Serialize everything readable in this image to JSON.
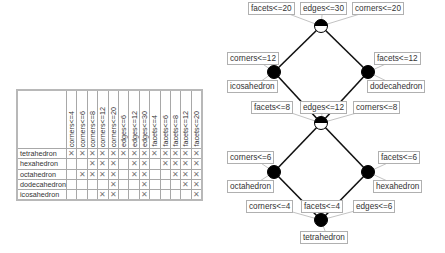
{
  "context_table": {
    "attributes": [
      "corners<=4",
      "corners<=6",
      "corners<=8",
      "corners<=12",
      "corners<=20",
      "edges<=6",
      "edges<=12",
      "edges<=30",
      "facets<=4",
      "facets<=6",
      "facets<=8",
      "facets<=12",
      "facets<=20"
    ],
    "cross_glyph": "✕",
    "objects": [
      {
        "name": "tetrahedron",
        "cells": [
          1,
          1,
          1,
          1,
          1,
          1,
          1,
          1,
          1,
          1,
          1,
          1,
          1
        ]
      },
      {
        "name": "hexahedron",
        "cells": [
          0,
          0,
          1,
          1,
          1,
          0,
          1,
          1,
          0,
          1,
          1,
          1,
          1
        ]
      },
      {
        "name": "octahedron",
        "cells": [
          0,
          1,
          1,
          1,
          1,
          0,
          1,
          1,
          0,
          0,
          1,
          1,
          1
        ]
      },
      {
        "name": "dodecahedron",
        "cells": [
          0,
          0,
          0,
          0,
          1,
          0,
          0,
          1,
          0,
          0,
          0,
          1,
          1
        ]
      },
      {
        "name": "icosahedron",
        "cells": [
          0,
          0,
          0,
          1,
          1,
          0,
          0,
          1,
          0,
          0,
          0,
          0,
          1
        ]
      }
    ]
  },
  "lattice": {
    "nodes": [
      {
        "id": "top",
        "x": 321,
        "y": 26,
        "fill": "half"
      },
      {
        "id": "icosa",
        "x": 274,
        "y": 72,
        "fill": "full"
      },
      {
        "id": "dodeca",
        "x": 368,
        "y": 72,
        "fill": "full"
      },
      {
        "id": "mid",
        "x": 321,
        "y": 123,
        "fill": "half"
      },
      {
        "id": "octa",
        "x": 274,
        "y": 172,
        "fill": "full"
      },
      {
        "id": "hexa",
        "x": 368,
        "y": 172,
        "fill": "full"
      },
      {
        "id": "bottom",
        "x": 321,
        "y": 220,
        "fill": "full"
      }
    ],
    "edges": [
      [
        "top",
        "icosa"
      ],
      [
        "top",
        "dodeca"
      ],
      [
        "icosa",
        "mid"
      ],
      [
        "dodeca",
        "mid"
      ],
      [
        "mid",
        "octa"
      ],
      [
        "mid",
        "hexa"
      ],
      [
        "octa",
        "bottom"
      ],
      [
        "hexa",
        "bottom"
      ]
    ],
    "labels": [
      {
        "text": "facets<=20",
        "x": 248,
        "y": 2,
        "node": "top"
      },
      {
        "text": "edges<=30",
        "x": 300,
        "y": 2,
        "node": "top"
      },
      {
        "text": "corners<=20",
        "x": 352,
        "y": 2,
        "node": "top"
      },
      {
        "text": "corners<=12",
        "x": 227,
        "y": 52,
        "node": "icosa"
      },
      {
        "text": "icosahedron",
        "x": 227,
        "y": 80,
        "node": "icosa"
      },
      {
        "text": "facets<=12",
        "x": 374,
        "y": 52,
        "node": "dodeca"
      },
      {
        "text": "dodecahedron",
        "x": 367,
        "y": 80,
        "node": "dodeca"
      },
      {
        "text": "facets<=8",
        "x": 251,
        "y": 101,
        "node": "mid"
      },
      {
        "text": "edges<=12",
        "x": 300,
        "y": 101,
        "node": "mid"
      },
      {
        "text": "corners<=8",
        "x": 353,
        "y": 101,
        "node": "mid"
      },
      {
        "text": "corners<=6",
        "x": 227,
        "y": 151,
        "node": "octa"
      },
      {
        "text": "octahedron",
        "x": 227,
        "y": 180,
        "node": "octa"
      },
      {
        "text": "facets<=6",
        "x": 378,
        "y": 151,
        "node": "hexa"
      },
      {
        "text": "hexahedron",
        "x": 373,
        "y": 180,
        "node": "hexa"
      },
      {
        "text": "corners<=4",
        "x": 246,
        "y": 200,
        "node": "bottom"
      },
      {
        "text": "facets<=4",
        "x": 301,
        "y": 200,
        "node": "bottom"
      },
      {
        "text": "edges<=6",
        "x": 353,
        "y": 200,
        "node": "bottom"
      },
      {
        "text": "tetrahedron",
        "x": 300,
        "y": 231,
        "node": "bottom"
      }
    ]
  }
}
